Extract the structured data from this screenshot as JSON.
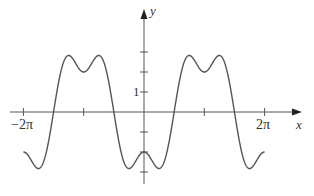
{
  "chart_data": {
    "type": "line",
    "title": "",
    "xlabel": "x",
    "ylabel": "y",
    "function": "y = -3cos(x) + cos(3x)",
    "xlim": [
      -6.2832,
      6.2832
    ],
    "ylim": [
      -3,
      3
    ],
    "x_ticks": [
      -6.2832,
      -3.1416,
      3.1416,
      6.2832
    ],
    "x_tick_labels": [
      "−2π",
      "",
      "",
      "2π"
    ],
    "y_ticks": [
      -3,
      -2,
      -1,
      1,
      2,
      3
    ],
    "y_tick_labels": [
      "",
      "",
      "",
      "1",
      "",
      ""
    ],
    "grid": false,
    "legend": null,
    "series": [
      {
        "name": "f(x)",
        "color": "#555555",
        "key_points": [
          {
            "x": -6.2832,
            "y": -2
          },
          {
            "x": -5.4978,
            "y": -2.83
          },
          {
            "x": -4.7124,
            "y": 0
          },
          {
            "x": -3.927,
            "y": 2.83
          },
          {
            "x": -3.1416,
            "y": 2
          },
          {
            "x": -2.3562,
            "y": 2.83
          },
          {
            "x": -1.5708,
            "y": 0
          },
          {
            "x": -0.7854,
            "y": -2.83
          },
          {
            "x": 0,
            "y": -2
          },
          {
            "x": 0.7854,
            "y": -2.83
          },
          {
            "x": 1.5708,
            "y": 0
          },
          {
            "x": 2.3562,
            "y": 2.83
          },
          {
            "x": 3.1416,
            "y": 2
          },
          {
            "x": 3.927,
            "y": 2.83
          },
          {
            "x": 4.7124,
            "y": 0
          },
          {
            "x": 5.4978,
            "y": -2.83
          },
          {
            "x": 6.2832,
            "y": -2
          }
        ]
      }
    ]
  },
  "labels": {
    "y_axis": "y",
    "x_axis": "x",
    "one": "1",
    "neg_two_pi": "−2π",
    "two_pi": "2π"
  },
  "colors": {
    "axis": "#555555",
    "curve": "#555555"
  }
}
